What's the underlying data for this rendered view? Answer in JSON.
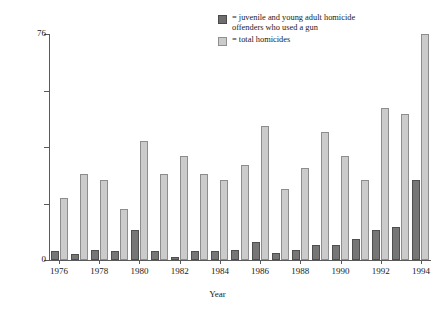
{
  "chart_data": {
    "type": "bar",
    "title": "",
    "xlabel": "Year",
    "ylabel": "Number of homicides",
    "ylim": [
      0,
      76
    ],
    "ytick_values": [
      0,
      19,
      38,
      57,
      76
    ],
    "ytick_labels": [
      "0",
      "",
      "",
      "",
      "76"
    ],
    "grid": false,
    "legend_position": "top-right",
    "categories": [
      "1976",
      "1977",
      "1978",
      "1979",
      "1980",
      "1981",
      "1982",
      "1983",
      "1984",
      "1985",
      "1986",
      "1987",
      "1988",
      "1989",
      "1990",
      "1991",
      "1992",
      "1993",
      "1994"
    ],
    "xtick_labels": [
      "1976",
      "1978",
      "1980",
      "1982",
      "1984",
      "1986",
      "1988",
      "1990",
      "1992",
      "1994"
    ],
    "xtick_categories": [
      "1976",
      "1978",
      "1980",
      "1982",
      "1984",
      "1986",
      "1988",
      "1990",
      "1992",
      "1994"
    ],
    "series": [
      {
        "name": "juvenile and young adult homicide offenders who used a gun",
        "color": "#767676",
        "values": [
          3,
          2,
          3.5,
          3,
          10,
          3,
          1,
          3,
          3,
          3.5,
          6,
          2.5,
          3.5,
          5,
          5,
          7,
          10,
          11,
          27
        ]
      },
      {
        "name": "total homicides",
        "color": "#cbcbcb",
        "values": [
          21,
          29,
          27,
          17,
          40,
          29,
          35,
          29,
          27,
          32,
          45,
          24,
          31,
          43,
          35,
          27,
          51,
          49,
          76
        ]
      }
    ],
    "legend": [
      {
        "swatch": "dark",
        "label": "= juvenile and young adult homicide\noffenders who used a gun"
      },
      {
        "swatch": "light",
        "label": "= total homicides"
      }
    ]
  }
}
